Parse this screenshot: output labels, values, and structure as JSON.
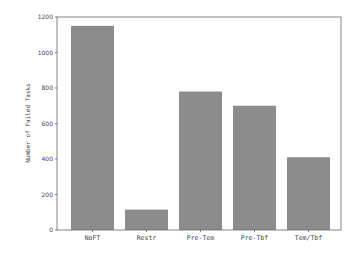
{
  "chart_data": {
    "type": "bar",
    "title": "",
    "xlabel": "",
    "ylabel": "Number of Failed Tasks",
    "categories": [
      "NoFT",
      "Restr",
      "Pre-Tem",
      "Pre-Tbf",
      "Tem/Tbf"
    ],
    "values": [
      1150,
      115,
      780,
      700,
      410
    ],
    "ylim": [
      0,
      1200
    ],
    "yticks": [
      0,
      200,
      400,
      600,
      800,
      1000,
      1200
    ],
    "grid": false,
    "legend": null,
    "bar_color": "#8c8c8c",
    "frame_color": "#666666"
  }
}
